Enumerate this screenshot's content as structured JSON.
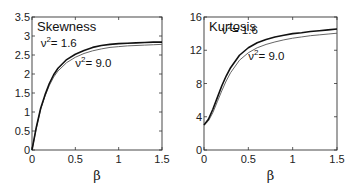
{
  "chart_data": [
    {
      "type": "line",
      "title": "Skewness",
      "xlabel": "β",
      "ylabel": "",
      "xlim": [
        0,
        1.5
      ],
      "ylim": [
        0,
        3.5
      ],
      "xticks": [
        "0",
        "0.5",
        "1",
        "1.5"
      ],
      "yticks": [
        "0",
        "0.5",
        "1",
        "1.5",
        "2",
        "2.5",
        "3",
        "3.5"
      ],
      "grid": false,
      "x": [
        0,
        0.05,
        0.1,
        0.15,
        0.2,
        0.25,
        0.3,
        0.4,
        0.5,
        0.6,
        0.7,
        0.8,
        0.9,
        1.0,
        1.1,
        1.2,
        1.3,
        1.4,
        1.5
      ],
      "series": [
        {
          "name": "ν² = 1.6",
          "values": [
            0,
            0.6,
            1.1,
            1.45,
            1.75,
            1.98,
            2.15,
            2.38,
            2.52,
            2.62,
            2.7,
            2.75,
            2.78,
            2.8,
            2.81,
            2.82,
            2.83,
            2.84,
            2.84
          ],
          "color": "#111111",
          "width": 1.6
        },
        {
          "name": "ν² = 9.0",
          "values": [
            0,
            0.58,
            1.07,
            1.42,
            1.7,
            1.92,
            2.08,
            2.3,
            2.44,
            2.54,
            2.61,
            2.66,
            2.7,
            2.72,
            2.74,
            2.75,
            2.76,
            2.77,
            2.78
          ],
          "color": "#555555",
          "width": 0.9
        }
      ],
      "annotations": [
        {
          "text": "ν",
          "sup": "2",
          "rest": "= 1.6",
          "x": 0.1,
          "y": 2.72
        },
        {
          "text": "ν",
          "sup": "2",
          "rest": "= 9.0",
          "x": 0.5,
          "y": 2.18
        }
      ]
    },
    {
      "type": "line",
      "title": "Kurtosis",
      "xlabel": "β",
      "ylabel": "",
      "xlim": [
        0,
        1.5
      ],
      "ylim": [
        0,
        16
      ],
      "xticks": [
        "0",
        "0.5",
        "1",
        "1.5"
      ],
      "yticks": [
        "0",
        "4",
        "8",
        "12",
        "16"
      ],
      "grid": false,
      "x": [
        0,
        0.05,
        0.1,
        0.15,
        0.2,
        0.25,
        0.3,
        0.4,
        0.5,
        0.6,
        0.7,
        0.8,
        0.9,
        1.0,
        1.1,
        1.2,
        1.3,
        1.4,
        1.5
      ],
      "series": [
        {
          "name": "ν² = 1.6",
          "values": [
            3,
            3.7,
            4.9,
            6.3,
            7.7,
            8.9,
            9.9,
            11.4,
            12.3,
            12.9,
            13.3,
            13.6,
            13.8,
            14.0,
            14.1,
            14.25,
            14.35,
            14.45,
            14.55
          ],
          "color": "#111111",
          "width": 1.6
        },
        {
          "name": "ν² = 9.0",
          "values": [
            3,
            3.5,
            4.5,
            5.8,
            7.1,
            8.3,
            9.3,
            10.8,
            11.7,
            12.3,
            12.7,
            13.0,
            13.25,
            13.45,
            13.6,
            13.75,
            13.85,
            13.95,
            14.05
          ],
          "color": "#555555",
          "width": 0.9
        }
      ],
      "annotations": [
        {
          "text": "ν",
          "sup": "2",
          "rest": "= 1.6",
          "x": 0.2,
          "y": 13.9
        },
        {
          "text": "ν",
          "sup": "2",
          "rest": "= 9.0",
          "x": 0.5,
          "y": 10.8
        }
      ]
    }
  ]
}
